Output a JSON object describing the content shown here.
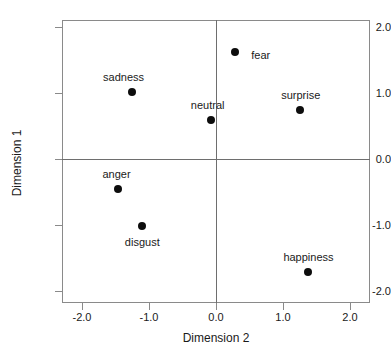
{
  "chart_data": {
    "type": "scatter",
    "title": "",
    "xlabel": "Dimension 2",
    "ylabel": "Dimension 1",
    "xlim": [
      -2.3,
      2.3
    ],
    "ylim": [
      -2.12,
      2.15
    ],
    "xticks": [
      "-2.0",
      "-1.0",
      "0.0",
      "1.0",
      "2.0"
    ],
    "xtick_values": [
      -2.0,
      -1.0,
      0.0,
      1.0,
      2.0
    ],
    "yticks": [
      "2.0",
      "1.0",
      "0.0",
      "-1.0",
      "-2.0"
    ],
    "ytick_values": [
      2.0,
      1.0,
      0.0,
      -1.0,
      -2.0
    ],
    "grid": false,
    "legend": "none",
    "zero_lines": true,
    "marker_color": "#0d0d0d",
    "frame_color": "#8a8a8a",
    "points": [
      {
        "label": "fear",
        "x": 0.28,
        "y": 1.63,
        "label_dx": 26,
        "label_dy": 3
      },
      {
        "label": "sadness",
        "x": -1.26,
        "y": 1.02,
        "label_dx": -8,
        "label_dy": -15
      },
      {
        "label": "neutral",
        "x": -0.08,
        "y": 0.6,
        "label_dx": -3,
        "label_dy": -15
      },
      {
        "label": "surprise",
        "x": 1.25,
        "y": 0.75,
        "label_dx": 1,
        "label_dy": -15
      },
      {
        "label": "anger",
        "x": -1.47,
        "y": -0.45,
        "label_dx": -1,
        "label_dy": -15
      },
      {
        "label": "disgust",
        "x": -1.1,
        "y": -1.02,
        "label_dx": 0,
        "label_dy": 16
      },
      {
        "label": "happiness",
        "x": 1.38,
        "y": -1.72,
        "label_dx": 0,
        "label_dy": -15
      }
    ]
  }
}
